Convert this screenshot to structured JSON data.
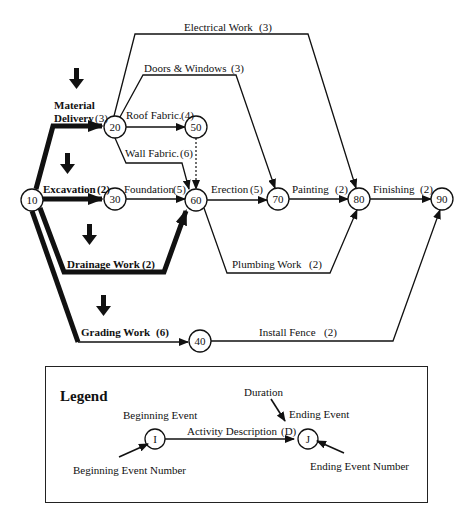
{
  "diagram": {
    "type": "activity-on-arrow network",
    "nodes": [
      {
        "id": "10",
        "x": 32,
        "y": 200
      },
      {
        "id": "20",
        "x": 115,
        "y": 127
      },
      {
        "id": "30",
        "x": 115,
        "y": 199
      },
      {
        "id": "50",
        "x": 196,
        "y": 127
      },
      {
        "id": "60",
        "x": 196,
        "y": 200
      },
      {
        "id": "70",
        "x": 278,
        "y": 199
      },
      {
        "id": "80",
        "x": 359,
        "y": 199
      },
      {
        "id": "90",
        "x": 442,
        "y": 199
      },
      {
        "id": "40",
        "x": 200,
        "y": 341
      }
    ],
    "activities": {
      "material_delivery": {
        "name": "Material",
        "name2": "Delivery",
        "duration": "(3)",
        "from": "10",
        "to": "20",
        "critical": true
      },
      "excavation": {
        "name": "Excavation",
        "duration": "(2)",
        "from": "10",
        "to": "30",
        "critical": true
      },
      "drainage": {
        "name": "Drainage Work",
        "duration": "(2)",
        "from": "10",
        "to": "60",
        "critical": true
      },
      "grading": {
        "name": "Grading Work",
        "duration": "(6)",
        "from": "10",
        "to": "40",
        "critical": true
      },
      "electrical": {
        "name": "Electrical Work",
        "duration": "(3)",
        "from": "20",
        "to": "80"
      },
      "doors": {
        "name": "Doors & Windows",
        "duration": "(3)",
        "from": "20",
        "to": "70"
      },
      "roof": {
        "name": "Roof Fabric.",
        "duration": "(4)",
        "from": "20",
        "to": "50"
      },
      "wall": {
        "name": "Wall Fabric.",
        "duration": "(6)",
        "from": "20",
        "to": "60"
      },
      "dummy": {
        "name": "",
        "duration": "",
        "from": "50",
        "to": "60",
        "dummy": true
      },
      "foundation": {
        "name": "Foundation",
        "duration": "(5)",
        "from": "30",
        "to": "60"
      },
      "erection": {
        "name": "Erection",
        "duration": "(5)",
        "from": "60",
        "to": "70"
      },
      "painting": {
        "name": "Painting",
        "duration": "(2)",
        "from": "70",
        "to": "80"
      },
      "plumbing": {
        "name": "Plumbing Work",
        "duration": "(2)",
        "from": "60",
        "to": "80"
      },
      "finishing": {
        "name": "Finishing",
        "duration": "(2)",
        "from": "80",
        "to": "90"
      },
      "fence": {
        "name": "Install Fence",
        "duration": "(2)",
        "from": "40",
        "to": "90"
      }
    }
  },
  "legend": {
    "title": "Legend",
    "beginning_event": "Beginning Event",
    "beginning_event_number": "Beginning Event Number",
    "activity_description": "Activity Description",
    "duration_symbol": "(D)",
    "duration": "Duration",
    "ending_event": "Ending Event",
    "ending_event_number": "Ending Event Number",
    "start_node": "I",
    "end_node": "J"
  },
  "colors": {
    "line": "#111111",
    "background": "#ffffff"
  }
}
